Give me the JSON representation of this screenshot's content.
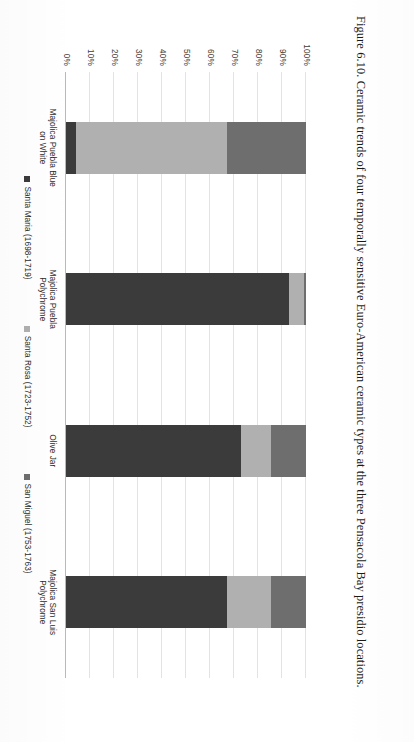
{
  "caption": "Figure 6.10. Ceramic trends of four temporally sensitive Euro-American ceramic types at the three Pensacola Bay presidio locations.",
  "colors": {
    "santa_maria": "#3b3b3b",
    "santa_rosa": "#b0b0b0",
    "san_miguel": "#6e6e6e",
    "gridline": "#e3e3e3",
    "axis": "#b9b9b9",
    "text": "#2b2b2b"
  },
  "legend": {
    "position": "bottom",
    "items": [
      {
        "label": "Santa Maria (1698-1719)",
        "color": "#3b3b3b"
      },
      {
        "label": "Santa Rosa (1723-1752)",
        "color": "#b0b0b0"
      },
      {
        "label": "San Miguel (1753-1763)",
        "color": "#6e6e6e"
      }
    ]
  },
  "chart_data": {
    "type": "bar",
    "subtype": "stacked-100-percent",
    "title": "",
    "xlabel": "",
    "ylabel": "",
    "ylim": [
      0,
      100
    ],
    "grid": true,
    "legend_position": "bottom",
    "categories": [
      "Majolica Puebla Blue on White",
      "Majolica Puebla Polychrome",
      "Olive Jar",
      "Majolica San Luis Polychrome"
    ],
    "ticks": [
      "0%",
      "10%",
      "20%",
      "30%",
      "40%",
      "50%",
      "60%",
      "70%",
      "80%",
      "90%",
      "100%"
    ],
    "series": [
      {
        "name": "Santa Maria (1698-1719)",
        "color": "#3b3b3b",
        "values": [
          4,
          93,
          73,
          67
        ]
      },
      {
        "name": "Santa Rosa (1723-1752)",
        "color": "#b0b0b0",
        "values": [
          63,
          6,
          12.5,
          18.5
        ]
      },
      {
        "name": "San Miguel (1753-1763)",
        "color": "#6e6e6e",
        "values": [
          33,
          1,
          14.5,
          14.5
        ]
      }
    ]
  }
}
